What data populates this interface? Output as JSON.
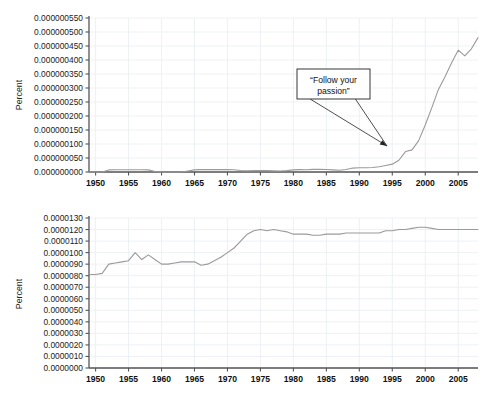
{
  "figure": {
    "background": "#ffffff",
    "line_color": "#9a9a9a",
    "grid_color": "#e9eef2",
    "axis_color": "#555555"
  },
  "chart_data": [
    {
      "id": "top",
      "type": "line",
      "title": "",
      "xlabel": "",
      "ylabel": "Percent",
      "xlim": [
        1949,
        2008
      ],
      "ylim": [
        0.0,
        5.5e-07
      ],
      "grid": true,
      "legend": "none",
      "xticks": [
        1950,
        1955,
        1960,
        1965,
        1970,
        1975,
        1980,
        1985,
        1990,
        1995,
        2000,
        2005
      ],
      "xticklabels": [
        "1950",
        "1955",
        "1960",
        "1965",
        "1970",
        "1975",
        "1980",
        "1985",
        "1990",
        "1995",
        "2000",
        "2005"
      ],
      "yticks": [
        0.0,
        5e-08,
        1e-07,
        1.5e-07,
        2e-07,
        2.5e-07,
        3e-07,
        3.5e-07,
        4e-07,
        4.5e-07,
        5e-07,
        5.5e-07
      ],
      "yticklabels": [
        "0.000000000",
        "0.000000050",
        "0.000000100",
        "0.000000150",
        "0.000000200",
        "0.000000250",
        "0.000000300",
        "0.000000350",
        "0.000000400",
        "0.000000450",
        "0.000000500",
        "0.000000550"
      ],
      "series": [
        {
          "name": "“Follow your passion”",
          "x": [
            1949,
            1950,
            1951,
            1952,
            1953,
            1954,
            1955,
            1956,
            1957,
            1958,
            1959,
            1960,
            1961,
            1962,
            1963,
            1964,
            1965,
            1966,
            1967,
            1968,
            1969,
            1970,
            1971,
            1972,
            1973,
            1974,
            1975,
            1976,
            1977,
            1978,
            1979,
            1980,
            1981,
            1982,
            1983,
            1984,
            1985,
            1986,
            1987,
            1988,
            1989,
            1990,
            1991,
            1992,
            1993,
            1994,
            1995,
            1996,
            1997,
            1998,
            1999,
            2000,
            2001,
            2002,
            2003,
            2004,
            2005,
            2006,
            2007,
            2008
          ],
          "values": [
            0,
            0,
            0,
            7.5e-09,
            8e-09,
            8e-09,
            8e-09,
            8e-09,
            8e-09,
            7.5e-09,
            2e-09,
            0,
            0,
            0,
            0,
            3.5e-09,
            7.5e-09,
            8.5e-09,
            8.5e-09,
            8.5e-09,
            8.5e-09,
            8.5e-09,
            8e-09,
            5.5e-09,
            4.5e-09,
            5e-09,
            5.5e-09,
            5e-09,
            4e-09,
            3.5e-09,
            5e-09,
            7.5e-09,
            8.5e-09,
            8e-09,
            9.5e-09,
            1e-08,
            9e-09,
            7.5e-09,
            6e-09,
            9e-09,
            1.4e-08,
            1.5e-08,
            1.5e-08,
            1.6e-08,
            1.85e-08,
            2.3e-08,
            2.8e-08,
            4.2e-08,
            7.3e-08,
            7.9e-08,
            1.12e-07,
            1.68e-07,
            2.3e-07,
            2.95e-07,
            3.4e-07,
            3.9e-07,
            4.35e-07,
            4.15e-07,
            4.4e-07,
            4.8e-07
          ]
        }
      ],
      "annotation": {
        "text_line1": "“Follow your",
        "text_line2": "passion”",
        "box": {
          "x": 297,
          "y": 69,
          "width": 73,
          "height": 30
        },
        "arrow_tip": {
          "x": 387,
          "y": 146
        }
      }
    },
    {
      "id": "bottom",
      "type": "line",
      "title": "",
      "xlabel": "",
      "ylabel": "Percent",
      "xlim": [
        1949,
        2008
      ],
      "ylim": [
        0.0,
        1.3e-05
      ],
      "grid": true,
      "legend": "none",
      "xticks": [
        1950,
        1955,
        1960,
        1965,
        1970,
        1975,
        1980,
        1985,
        1990,
        1995,
        2000,
        2005
      ],
      "xticklabels": [
        "1950",
        "1955",
        "1960",
        "1965",
        "1970",
        "1975",
        "1980",
        "1985",
        "1990",
        "1995",
        "2000",
        "2005"
      ],
      "yticks": [
        0.0,
        1e-06,
        2e-06,
        3e-06,
        4e-06,
        5e-06,
        6e-06,
        7e-06,
        8e-06,
        9e-06,
        1e-05,
        1.1e-05,
        1.2e-05,
        1.3e-05
      ],
      "yticklabels": [
        "0.0000000",
        "0.0000010",
        "0.0000020",
        "0.0000030",
        "0.0000040",
        "0.0000050",
        "0.0000060",
        "0.0000070",
        "0.0000080",
        "0.0000090",
        "0.0000100",
        "0.0000110",
        "0.0000120",
        "0.0000130"
      ],
      "series": [
        {
          "name": "“Earn more money”",
          "x": [
            1949,
            1950,
            1951,
            1952,
            1953,
            1954,
            1955,
            1956,
            1957,
            1958,
            1959,
            1960,
            1961,
            1962,
            1963,
            1964,
            1965,
            1966,
            1967,
            1968,
            1969,
            1970,
            1971,
            1972,
            1973,
            1974,
            1975,
            1976,
            1977,
            1978,
            1979,
            1980,
            1981,
            1982,
            1983,
            1984,
            1985,
            1986,
            1987,
            1988,
            1989,
            1990,
            1991,
            1992,
            1993,
            1994,
            1995,
            1996,
            1997,
            1998,
            1999,
            2000,
            2001,
            2002,
            2003,
            2004,
            2005,
            2006,
            2007,
            2008
          ],
          "values": [
            8.1e-06,
            8.1e-06,
            8.2e-06,
            9e-06,
            9.1e-06,
            9.2e-06,
            9.3e-06,
            1e-05,
            9.4e-06,
            9.8e-06,
            9.4e-06,
            9e-06,
            9e-06,
            9.1e-06,
            9.2e-06,
            9.2e-06,
            9.2e-06,
            8.9e-06,
            9e-06,
            9.3e-06,
            9.6e-06,
            1e-05,
            1.04e-05,
            1.1e-05,
            1.16e-05,
            1.19e-05,
            1.2e-05,
            1.19e-05,
            1.2e-05,
            1.19e-05,
            1.18e-05,
            1.16e-05,
            1.16e-05,
            1.16e-05,
            1.15e-05,
            1.15e-05,
            1.16e-05,
            1.16e-05,
            1.16e-05,
            1.17e-05,
            1.17e-05,
            1.17e-05,
            1.17e-05,
            1.17e-05,
            1.17e-05,
            1.19e-05,
            1.19e-05,
            1.2e-05,
            1.2e-05,
            1.21e-05,
            1.22e-05,
            1.22e-05,
            1.21e-05,
            1.2e-05,
            1.2e-05,
            1.2e-05,
            1.2e-05,
            1.2e-05,
            1.2e-05,
            1.2e-05
          ]
        }
      ],
      "annotation": {
        "text_line1": "“Earn more",
        "text_line2": "money”",
        "box": {
          "x": 323,
          "y": 264,
          "width": 73,
          "height": 33
        },
        "arrow_tip": {
          "x": 417,
          "y": 227
        }
      }
    }
  ]
}
